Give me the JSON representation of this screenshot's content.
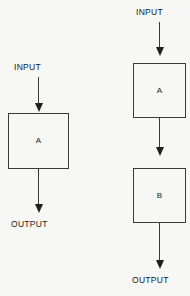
{
  "figure": {
    "background_color": "#f7f7f5",
    "line_color": "#3a3a3a",
    "text_color": "#1a1a1a"
  },
  "diagrams": {
    "single_stage": {
      "name": "single-stage-block-diagram",
      "input_label": "INPUT",
      "output_label": "OUTPUT",
      "blocks": [
        {
          "label": "A"
        }
      ]
    },
    "cascade_stage": {
      "name": "two-stage-cascade-block-diagram",
      "input_label": "INPUT",
      "output_label": "OUTPUT",
      "blocks": [
        {
          "label": "A"
        },
        {
          "label": "B"
        }
      ]
    }
  }
}
